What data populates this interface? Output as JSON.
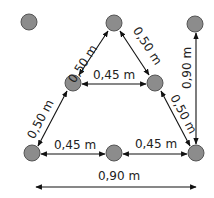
{
  "diagram": {
    "title": "",
    "colors": {
      "node_fill": "#8c8c8c",
      "node_stroke": "#555555",
      "line": "#111111",
      "text": "#222222"
    },
    "nodes": [
      {
        "id": "n1",
        "x": 29,
        "y": 22
      },
      {
        "id": "n2",
        "x": 114,
        "y": 23
      },
      {
        "id": "n3",
        "x": 195,
        "y": 24
      },
      {
        "id": "n4",
        "x": 73,
        "y": 83
      },
      {
        "id": "n5",
        "x": 155,
        "y": 83
      },
      {
        "id": "n6",
        "x": 32,
        "y": 153
      },
      {
        "id": "n7",
        "x": 114,
        "y": 153
      },
      {
        "id": "n8",
        "x": 196,
        "y": 153
      }
    ],
    "dimensions": [
      {
        "from": "n2",
        "to": "n4",
        "label": "0,50 m"
      },
      {
        "from": "n2",
        "to": "n5",
        "label": "0,50 m"
      },
      {
        "from": "n4",
        "to": "n5",
        "label": "0,45 m"
      },
      {
        "from": "n4",
        "to": "n6",
        "label": "0,50 m"
      },
      {
        "from": "n5",
        "to": "n8",
        "label": "0,50 m"
      },
      {
        "from": "n3",
        "to": "n8",
        "label": "0,90 m"
      },
      {
        "from": "n6",
        "to": "n7",
        "label": "0,45 m"
      },
      {
        "from": "n7",
        "to": "n8",
        "label": "0,45 m"
      },
      {
        "from": "n6",
        "to": "n8",
        "label": "0,90 m",
        "offset": "below"
      }
    ]
  }
}
